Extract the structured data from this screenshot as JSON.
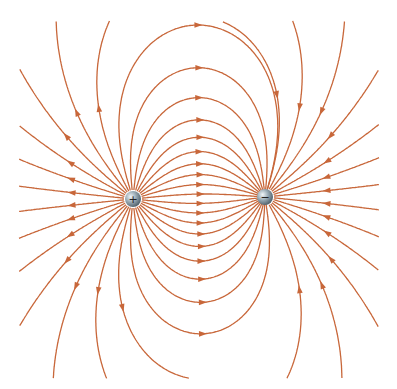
{
  "diagram": {
    "line_color": "#c8673a",
    "charges": [
      {
        "sign": "+",
        "label": "+",
        "x": 133,
        "y": 199,
        "r": 8
      },
      {
        "sign": "-",
        "label": "−",
        "x": 265,
        "y": 197,
        "r": 8
      }
    ],
    "line_count": 32,
    "bounds": {
      "x0": 20,
      "y0": 22,
      "x1": 378,
      "y1": 378
    }
  }
}
